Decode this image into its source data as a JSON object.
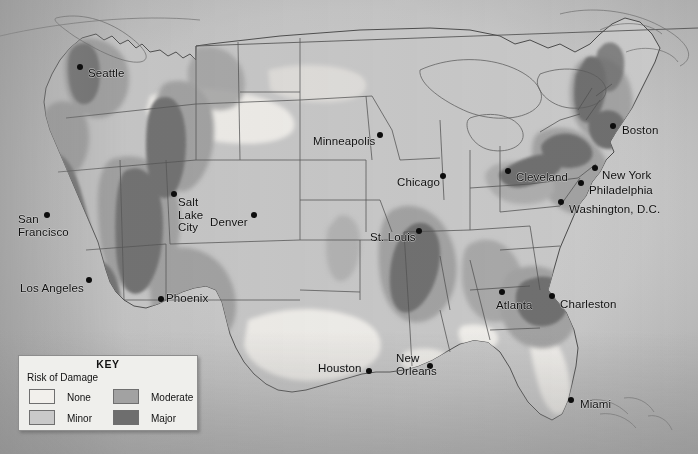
{
  "map": {
    "title": "Earthquake Risk of Damage Map of the United States",
    "type": "choropleth-risk-map",
    "region": "Contiguous United States",
    "background_color": "#b9b9b9",
    "border_color": "#4a4a4a"
  },
  "legend": {
    "title": "KEY",
    "subtitle": "Risk of Damage",
    "items": [
      {
        "label": "None",
        "color": "#f2f0ec"
      },
      {
        "label": "Minor",
        "color": "#c9c9c9"
      },
      {
        "label": "Moderate",
        "color": "#a2a2a2"
      },
      {
        "label": "Major",
        "color": "#6e6e6e"
      }
    ]
  },
  "cities": [
    {
      "name": "Seattle",
      "label": "Seattle",
      "x": 80,
      "y": 67,
      "label_x": 88,
      "label_y": 68,
      "risk": "Major"
    },
    {
      "name": "San Francisco",
      "label": "San\nFrancisco",
      "x": 47,
      "y": 215,
      "label_x": 18,
      "label_y": 213,
      "risk": "Major"
    },
    {
      "name": "Los Angeles",
      "label": "Los Angeles",
      "x": 89,
      "y": 280,
      "label_x": 20,
      "label_y": 283,
      "risk": "Major"
    },
    {
      "name": "Salt Lake City",
      "label": "Salt\nLake\nCity",
      "x": 174,
      "y": 194,
      "label_x": 178,
      "label_y": 196,
      "risk": "Major"
    },
    {
      "name": "Denver",
      "label": "Denver",
      "x": 254,
      "y": 215,
      "label_x": 210,
      "label_y": 217,
      "risk": "Minor"
    },
    {
      "name": "Phoenix",
      "label": "Phoenix",
      "x": 161,
      "y": 299,
      "label_x": 166,
      "label_y": 293,
      "risk": "Moderate"
    },
    {
      "name": "Minneapolis",
      "label": "Minneapolis",
      "x": 380,
      "y": 135,
      "label_x": 313,
      "label_y": 136,
      "risk": "Minor"
    },
    {
      "name": "Chicago",
      "label": "Chicago",
      "x": 443,
      "y": 176,
      "label_x": 397,
      "label_y": 177,
      "risk": "Minor"
    },
    {
      "name": "St. Louis",
      "label": "St. Louis",
      "x": 419,
      "y": 231,
      "label_x": 370,
      "label_y": 232,
      "risk": "Moderate"
    },
    {
      "name": "Cleveland",
      "label": "Cleveland",
      "x": 508,
      "y": 171,
      "label_x": 516,
      "label_y": 172,
      "risk": "Minor"
    },
    {
      "name": "Boston",
      "label": "Boston",
      "x": 613,
      "y": 126,
      "label_x": 622,
      "label_y": 125,
      "risk": "Major"
    },
    {
      "name": "New York",
      "label": "New York",
      "x": 595,
      "y": 168,
      "label_x": 602,
      "label_y": 170,
      "risk": "Moderate"
    },
    {
      "name": "Philadelphia",
      "label": "Philadelphia",
      "x": 581,
      "y": 183,
      "label_x": 589,
      "label_y": 185,
      "risk": "Moderate"
    },
    {
      "name": "Washington, D.C.",
      "label": "Washington, D.C.",
      "x": 561,
      "y": 202,
      "label_x": 569,
      "label_y": 204,
      "risk": "Moderate"
    },
    {
      "name": "Atlanta",
      "label": "Atlanta",
      "x": 502,
      "y": 292,
      "label_x": 496,
      "label_y": 300,
      "risk": "Moderate"
    },
    {
      "name": "Charleston",
      "label": "Charleston",
      "x": 552,
      "y": 296,
      "label_x": 560,
      "label_y": 299,
      "risk": "Major"
    },
    {
      "name": "Miami",
      "label": "Miami",
      "x": 571,
      "y": 400,
      "label_x": 580,
      "label_y": 399,
      "risk": "None"
    },
    {
      "name": "Houston",
      "label": "Houston",
      "x": 369,
      "y": 371,
      "label_x": 318,
      "label_y": 363,
      "risk": "None"
    },
    {
      "name": "New Orleans",
      "label": "New\nOrleans",
      "x": 430,
      "y": 366,
      "label_x": 396,
      "label_y": 352,
      "risk": "None"
    }
  ]
}
